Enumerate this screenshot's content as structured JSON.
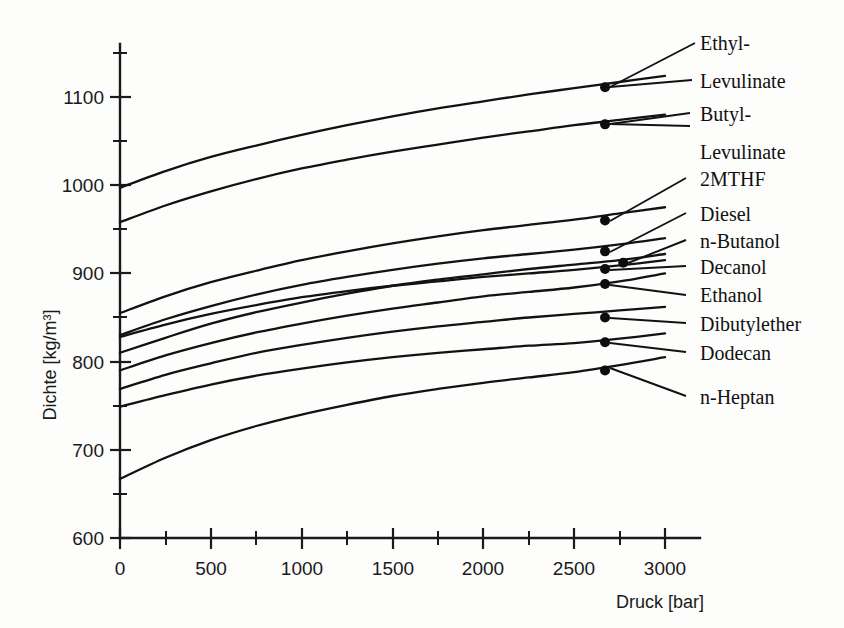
{
  "chart_data": {
    "type": "line",
    "title": "",
    "xlabel": "Druck [bar]",
    "ylabel": "Dichte [kg/m³]",
    "xlim": [
      0,
      3000
    ],
    "ylim": [
      600,
      1150
    ],
    "grid": false,
    "legend_position": "right-callout",
    "x_ticks": [
      0,
      500,
      1000,
      1500,
      2000,
      2500,
      3000
    ],
    "x_tick_labels": [
      "0",
      "500",
      "1000",
      "1500",
      "2000",
      "2500",
      "3000"
    ],
    "x_minor_ticks": [
      250,
      750,
      1250,
      1750,
      2250,
      2750
    ],
    "y_ticks": [
      600,
      700,
      800,
      900,
      1000,
      1100
    ],
    "y_tick_labels": [
      "600",
      "700",
      "800",
      "900",
      "1000",
      "1100"
    ],
    "y_minor_ticks": [
      650,
      750,
      850,
      950,
      1050,
      1150
    ],
    "x": [
      0,
      250,
      500,
      750,
      1000,
      1250,
      1500,
      1750,
      2000,
      2250,
      2500,
      2750,
      3000
    ],
    "series": [
      {
        "name": "Ethyl-Levulinate",
        "label_lines": [
          "Ethyl-",
          "Levulinate"
        ],
        "marker_x": 2670,
        "marker_y": 1111,
        "values": [
          997,
          1016,
          1032,
          1045,
          1057,
          1068,
          1078,
          1087,
          1095,
          1103,
          1110,
          1117,
          1124
        ]
      },
      {
        "name": "Butyl-Levulinate",
        "label_lines": [
          "Butyl-",
          "Levulinate"
        ],
        "marker_x": 2670,
        "marker_y": 1069,
        "values": [
          958,
          977,
          993,
          1007,
          1019,
          1029,
          1038,
          1046,
          1054,
          1061,
          1068,
          1074,
          1080
        ]
      },
      {
        "name": "2MTHF",
        "label_lines": [
          "2MTHF"
        ],
        "marker_x": 2670,
        "marker_y": 960,
        "values": [
          855,
          874,
          890,
          903,
          915,
          925,
          934,
          942,
          949,
          955,
          961,
          968,
          975
        ]
      },
      {
        "name": "Diesel",
        "label_lines": [
          "Diesel"
        ],
        "marker_x": 2670,
        "marker_y": 925,
        "values": [
          830,
          848,
          863,
          876,
          887,
          896,
          904,
          911,
          917,
          922,
          927,
          933,
          940
        ]
      },
      {
        "name": "n-Butanol",
        "label_lines": [
          "n-Butanol"
        ],
        "marker_x": 2770,
        "marker_y": 912,
        "values": [
          810,
          827,
          843,
          856,
          867,
          877,
          886,
          893,
          899,
          905,
          910,
          915,
          922
        ]
      },
      {
        "name": "Decanol",
        "label_lines": [
          "Decanol"
        ],
        "marker_x": 2670,
        "marker_y": 905,
        "values": [
          828,
          842,
          854,
          864,
          873,
          880,
          886,
          891,
          896,
          900,
          904,
          909,
          915
        ]
      },
      {
        "name": "Ethanol",
        "label_lines": [
          "Ethanol"
        ],
        "marker_x": 2670,
        "marker_y": 888,
        "values": [
          790,
          807,
          821,
          833,
          843,
          852,
          860,
          867,
          874,
          879,
          884,
          891,
          900
        ]
      },
      {
        "name": "Dibutylether",
        "label_lines": [
          "Dibutylether"
        ],
        "marker_x": 2670,
        "marker_y": 850,
        "values": [
          769,
          785,
          798,
          810,
          819,
          827,
          834,
          840,
          845,
          850,
          854,
          858,
          862
        ]
      },
      {
        "name": "Dodecan",
        "label_lines": [
          "Dodecan"
        ],
        "marker_x": 2670,
        "marker_y": 822,
        "values": [
          749,
          762,
          774,
          784,
          792,
          799,
          805,
          810,
          814,
          818,
          821,
          826,
          832
        ]
      },
      {
        "name": "n-Heptan",
        "label_lines": [
          "n-Heptan"
        ],
        "marker_x": 2670,
        "marker_y": 790,
        "values": [
          667,
          691,
          711,
          727,
          740,
          751,
          761,
          769,
          776,
          782,
          788,
          796,
          805
        ]
      }
    ]
  },
  "labels": {
    "ethyl_levulinate_1": "Ethyl-",
    "ethyl_levulinate_2": "Levulinate",
    "butyl_levulinate_1": "Butyl-",
    "butyl_levulinate_2": "Levulinate",
    "mthf": "2MTHF",
    "diesel": "Diesel",
    "n_butanol": "n-Butanol",
    "decanol": "Decanol",
    "ethanol": "Ethanol",
    "dibutylether": "Dibutylether",
    "dodecan": "Dodecan",
    "n_heptan": "n-Heptan"
  },
  "axes": {
    "y_title": "Dichte [kg/m³]",
    "x_title": "Druck [bar]",
    "y0": "600",
    "y1": "700",
    "y2": "800",
    "y3": "900",
    "y4": "1000",
    "y5": "1100",
    "x0": "0",
    "x1": "500",
    "x2": "1000",
    "x3": "1500",
    "x4": "2000",
    "x5": "2500",
    "x6": "3000"
  }
}
